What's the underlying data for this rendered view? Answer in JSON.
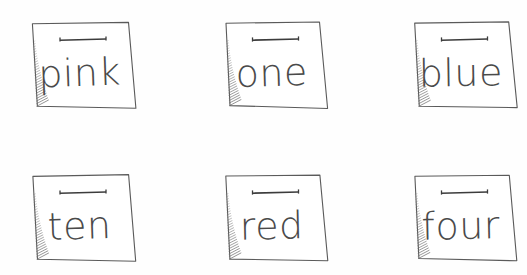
{
  "scene": {
    "title": "Hand-drawn word cards",
    "description": "Six sketched note cards arranged in two rows of three, each showing a handwritten lowercase word",
    "background_color": "#fefefe",
    "ink_color": "#4a4a4a",
    "outline_color": "#5a5a5a",
    "shade_color": "#6b6b6b",
    "rows": 2,
    "columns": 3
  },
  "cards": [
    {
      "id": "card-pink",
      "word": "pink",
      "row": 1,
      "column": 1,
      "x": 32,
      "y": 22,
      "width": 98,
      "height": 86,
      "word_x": 80,
      "word_y": 86,
      "font_size": 38
    },
    {
      "id": "card-one",
      "word": "one",
      "row": 1,
      "column": 2,
      "x": 225,
      "y": 22,
      "width": 97,
      "height": 86,
      "word_x": 272,
      "word_y": 86,
      "font_size": 38
    },
    {
      "id": "card-blue",
      "word": "blue",
      "row": 1,
      "column": 3,
      "x": 414,
      "y": 22,
      "width": 97,
      "height": 86,
      "word_x": 461,
      "word_y": 86,
      "font_size": 38
    },
    {
      "id": "card-ten",
      "word": "ten",
      "row": 2,
      "column": 1,
      "x": 32,
      "y": 175,
      "width": 98,
      "height": 86,
      "word_x": 80,
      "word_y": 239,
      "font_size": 38
    },
    {
      "id": "card-red",
      "word": "red",
      "row": 2,
      "column": 2,
      "x": 225,
      "y": 175,
      "width": 97,
      "height": 86,
      "word_x": 272,
      "word_y": 239,
      "font_size": 38
    },
    {
      "id": "card-four",
      "word": "four",
      "row": 2,
      "column": 3,
      "x": 414,
      "y": 175,
      "width": 97,
      "height": 86,
      "word_x": 461,
      "word_y": 239,
      "font_size": 38
    }
  ],
  "card_marks": {
    "dash_label": "top-tab-dash",
    "dash_width": 46,
    "dash_offset_y": 17,
    "shade_label": "left-edge-hatch-shadow"
  }
}
